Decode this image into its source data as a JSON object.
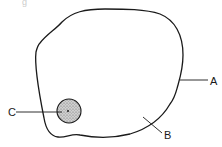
{
  "figure": {
    "caption_fragment": "g",
    "labels": {
      "a": "A",
      "b": "B",
      "c": "C"
    },
    "colors": {
      "outline": "#1a1a1a",
      "nucleus_fill": "#b8b8b8",
      "background": "#ffffff"
    }
  }
}
